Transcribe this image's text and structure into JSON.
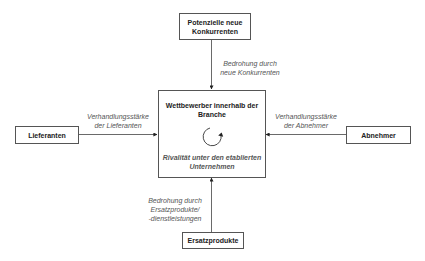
{
  "diagram": {
    "center": {
      "title": "Wettbewerber innerhalb der Branche",
      "title_line1": "Wettbewerber innerhalb der",
      "title_line2": "Branche",
      "icon": "circular-arrow-icon",
      "subtitle_line1": "Rivalität unter den etablierten",
      "subtitle_line2": "Unternehmen"
    },
    "top": {
      "line1": "Potenzielle neue",
      "line2": "Konkurrenten",
      "arrow_label_line1": "Bedrohung durch",
      "arrow_label_line2": "neue Konkurrenten"
    },
    "left": {
      "label": "Lieferanten",
      "arrow_label_line1": "Verhandlungsstärke",
      "arrow_label_line2": "der Lieferanten"
    },
    "right": {
      "label": "Abnehmer",
      "arrow_label_line1": "Verhandlungsstärke",
      "arrow_label_line2": "der Abnehmer"
    },
    "bottom": {
      "label": "Ersatzprodukte",
      "arrow_label_line1": "Bedrohung durch",
      "arrow_label_line2": "Ersatzprodukte/",
      "arrow_label_line3": "-dienstleistungen"
    },
    "colors": {
      "border": "#555555",
      "line": "#444444",
      "italic_text": "#555555"
    }
  }
}
